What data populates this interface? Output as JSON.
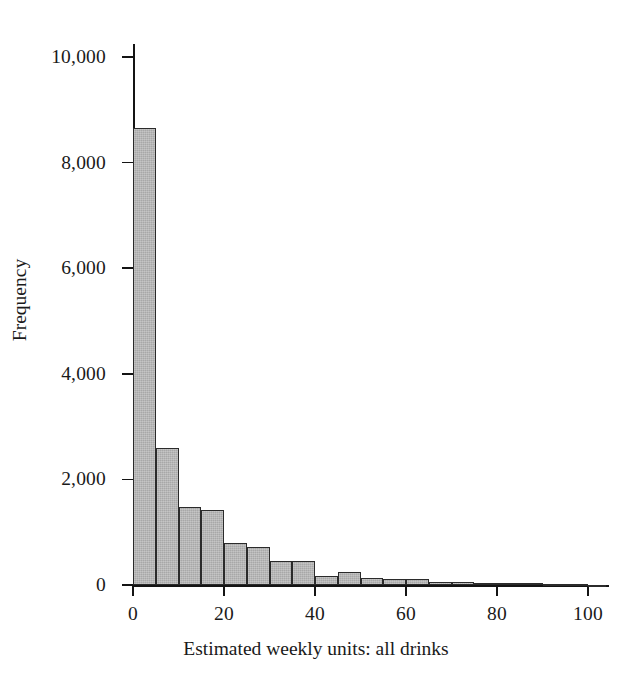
{
  "figure": {
    "background_color": "#ffffff",
    "bar_fill_color": "#a8a8a8",
    "bar_border_color": "#2b2b2b",
    "axis_color": "#141414"
  },
  "chart_data": {
    "type": "bar",
    "title": "",
    "subtitle": "",
    "xlabel": "Estimated weekly units: all drinks",
    "ylabel": "Frequency",
    "xlim": [
      0,
      104
    ],
    "ylim": [
      0,
      10400
    ],
    "grid": false,
    "legend": null,
    "bin_width": 5,
    "x_ticks": [
      0,
      20,
      40,
      60,
      80,
      100
    ],
    "x_tick_labels": [
      "0",
      "20",
      "40",
      "60",
      "80",
      "100"
    ],
    "y_ticks": [
      0,
      2000,
      4000,
      6000,
      8000,
      10000
    ],
    "y_tick_labels": [
      "0",
      "2,000",
      "4,000",
      "6,000",
      "8,000",
      "10,000"
    ],
    "bins": [
      {
        "x0": 0,
        "x1": 5,
        "value": 8650
      },
      {
        "x0": 5,
        "x1": 10,
        "value": 2600
      },
      {
        "x0": 10,
        "x1": 15,
        "value": 1480
      },
      {
        "x0": 15,
        "x1": 20,
        "value": 1420
      },
      {
        "x0": 20,
        "x1": 25,
        "value": 790
      },
      {
        "x0": 25,
        "x1": 30,
        "value": 720
      },
      {
        "x0": 30,
        "x1": 35,
        "value": 450
      },
      {
        "x0": 35,
        "x1": 40,
        "value": 450
      },
      {
        "x0": 40,
        "x1": 45,
        "value": 165
      },
      {
        "x0": 45,
        "x1": 50,
        "value": 250
      },
      {
        "x0": 50,
        "x1": 55,
        "value": 130
      },
      {
        "x0": 55,
        "x1": 60,
        "value": 110
      },
      {
        "x0": 60,
        "x1": 65,
        "value": 120
      },
      {
        "x0": 65,
        "x1": 70,
        "value": 60
      },
      {
        "x0": 70,
        "x1": 75,
        "value": 55
      },
      {
        "x0": 75,
        "x1": 80,
        "value": 40
      },
      {
        "x0": 80,
        "x1": 85,
        "value": 30
      },
      {
        "x0": 85,
        "x1": 90,
        "value": 35
      },
      {
        "x0": 90,
        "x1": 95,
        "value": 15
      },
      {
        "x0": 95,
        "x1": 100,
        "value": 12
      },
      {
        "x0": 100,
        "x1": 104,
        "value": 8
      }
    ]
  }
}
